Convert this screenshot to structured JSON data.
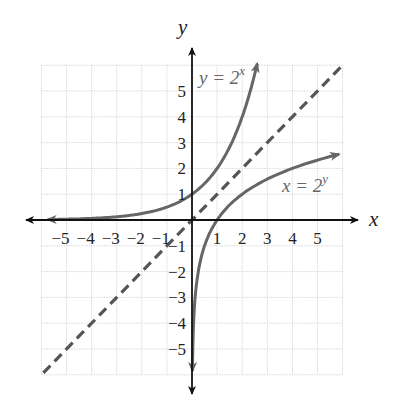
{
  "chart_data": {
    "type": "line",
    "title": "",
    "xlabel": "x",
    "ylabel": "y",
    "xlim": [
      -6,
      6
    ],
    "ylim": [
      -6,
      6
    ],
    "grid": true,
    "x_ticks": [
      "-5",
      "-4",
      "-3",
      "-2",
      "-1",
      "1",
      "2",
      "3",
      "4",
      "5"
    ],
    "y_ticks": [
      "5",
      "4",
      "3",
      "2",
      "1",
      "-1",
      "-2",
      "-3",
      "-4",
      "-5"
    ],
    "series": [
      {
        "name": "y = 2^x",
        "style": "solid",
        "color": "#666666",
        "x": [
          -5.8,
          -5,
          -4,
          -3,
          -2,
          -1,
          0,
          1,
          2,
          2.6
        ],
        "y": [
          0.018,
          0.031,
          0.0625,
          0.125,
          0.25,
          0.5,
          1,
          2,
          4,
          6.06
        ]
      },
      {
        "name": "x = 2^y",
        "style": "solid",
        "color": "#666666",
        "x": [
          0.018,
          0.031,
          0.0625,
          0.125,
          0.25,
          0.5,
          1,
          2,
          4,
          5.9
        ],
        "y": [
          -5.8,
          -5,
          -4,
          -3,
          -2,
          -1,
          0,
          1,
          2,
          2.56
        ]
      },
      {
        "name": "y = x",
        "style": "dashed",
        "color": "#555555",
        "x": [
          -6,
          6
        ],
        "y": [
          -6,
          6
        ]
      }
    ],
    "annotations": [
      {
        "text": "y = 2",
        "sup": "x",
        "at": [
          0.3,
          5.7
        ]
      },
      {
        "text": "x = 2",
        "sup": "y",
        "at": [
          3.6,
          1.3
        ]
      }
    ]
  },
  "labels": {
    "x_axis": "x",
    "y_axis": "y",
    "eq1_base": "y = 2",
    "eq1_exp": "x",
    "eq2_base": "x = 2",
    "eq2_exp": "y"
  }
}
